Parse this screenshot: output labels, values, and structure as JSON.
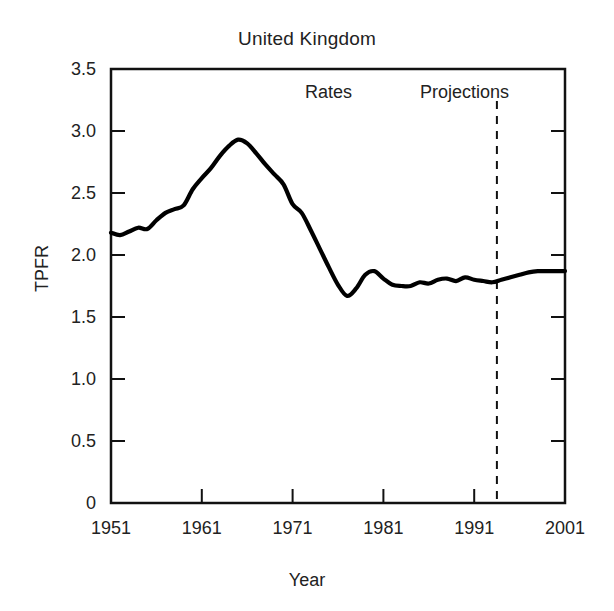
{
  "chart_data": {
    "type": "line",
    "title": "United Kingdom",
    "xlabel": "Year",
    "ylabel": "TPFR",
    "xlim": [
      1951,
      2001
    ],
    "ylim": [
      0,
      3.5
    ],
    "grid": false,
    "legend_position": "none",
    "xticks": [
      "1951",
      "1961",
      "1971",
      "1981",
      "1991",
      "2001"
    ],
    "xtick_values": [
      1951,
      1961,
      1971,
      1981,
      1991,
      2001
    ],
    "yticks": [
      "0",
      "0.5",
      "1.0",
      "1.5",
      "2.0",
      "2.5",
      "3.0",
      "3.5"
    ],
    "ytick_values": [
      0,
      0.5,
      1.0,
      1.5,
      2.0,
      2.5,
      3.0,
      3.5
    ],
    "annotations": [
      {
        "text": "Rates",
        "x": 1975,
        "y": 3.28
      },
      {
        "text": "Projections",
        "x": 1988,
        "y": 3.28
      }
    ],
    "divider": {
      "label": "projection-start",
      "x": 1993.5,
      "style": "dashed"
    },
    "series": [
      {
        "name": "TPFR",
        "x": [
          1951,
          1952,
          1953,
          1954,
          1955,
          1956,
          1957,
          1958,
          1959,
          1960,
          1961,
          1962,
          1963,
          1964,
          1965,
          1966,
          1967,
          1968,
          1969,
          1970,
          1971,
          1972,
          1973,
          1974,
          1975,
          1976,
          1977,
          1978,
          1979,
          1980,
          1981,
          1982,
          1983,
          1984,
          1985,
          1986,
          1987,
          1988,
          1989,
          1990,
          1991,
          1992,
          1993,
          1994,
          1995,
          1996,
          1997,
          1998,
          1999,
          2000,
          2001
        ],
        "values": [
          2.18,
          2.16,
          2.19,
          2.22,
          2.21,
          2.28,
          2.34,
          2.37,
          2.4,
          2.53,
          2.62,
          2.7,
          2.8,
          2.88,
          2.93,
          2.9,
          2.82,
          2.73,
          2.65,
          2.57,
          2.41,
          2.34,
          2.2,
          2.05,
          1.9,
          1.76,
          1.67,
          1.73,
          1.84,
          1.87,
          1.81,
          1.76,
          1.75,
          1.75,
          1.78,
          1.77,
          1.8,
          1.81,
          1.79,
          1.82,
          1.8,
          1.79,
          1.78,
          1.8,
          1.82,
          1.84,
          1.86,
          1.87,
          1.87,
          1.87,
          1.87
        ]
      }
    ]
  },
  "axes": {
    "title": "United Kingdom",
    "ylabel": "TPFR",
    "xlabel": "Year"
  }
}
